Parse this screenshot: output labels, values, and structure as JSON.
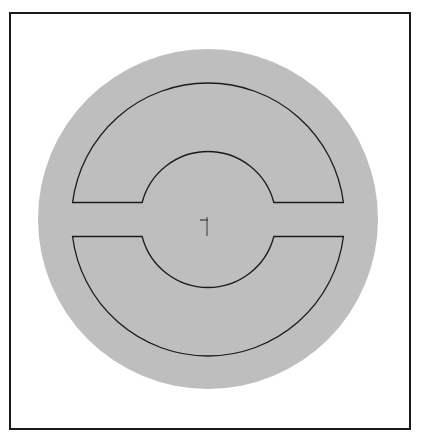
{
  "diagram": {
    "colors": {
      "background": "#ffffff",
      "frame": "#1a1a1a",
      "disk_fill": "#bebebe",
      "outline": "#1a1a1a",
      "cursor": "#3a3a3a"
    },
    "disk": {
      "cx": 208,
      "cy": 219,
      "r": 170
    },
    "rings": {
      "center": {
        "cx": 208,
        "cy": 219.5
      },
      "outer_radius": 136.5,
      "inner_radius": 68,
      "gap_half_height": 17
    },
    "shapes": [
      {
        "name": "upper-half-ring",
        "position": "top"
      },
      {
        "name": "lower-half-ring",
        "position": "bottom"
      }
    ],
    "cursor": {
      "x": 207,
      "y": 220,
      "type": "crosshair-tick"
    }
  }
}
